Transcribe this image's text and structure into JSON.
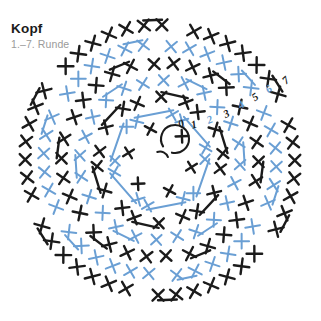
{
  "title": "Kopf",
  "subtitle": "1.–7. Runde",
  "colors": {
    "black": "#1b1b1b",
    "blue": "#6a9fd4",
    "title": "#1b1b1b",
    "subtitle": "#9a9a9a",
    "background": "#ffffff"
  },
  "center": {
    "x": 160,
    "y": 160,
    "ring_radius": 14,
    "icon": "magic-ring-icon"
  },
  "round_labels": [
    {
      "text": "0",
      "x": 182,
      "y": 127,
      "color": "#1b1b1b",
      "rotate": -18,
      "size": 11
    },
    {
      "text": "1",
      "x": 195,
      "y": 128,
      "color": "#1b1b1b",
      "rotate": -16,
      "size": 12
    },
    {
      "text": "2",
      "x": 211,
      "y": 123,
      "color": "#6a9fd4",
      "rotate": -22,
      "size": 11
    },
    {
      "text": "3",
      "x": 228,
      "y": 117,
      "color": "#1b1b1b",
      "rotate": -26,
      "size": 11
    },
    {
      "text": "4",
      "x": 243,
      "y": 108,
      "color": "#6a9fd4",
      "rotate": -30,
      "size": 11
    },
    {
      "text": "5",
      "x": 257,
      "y": 100,
      "color": "#1b1b1b",
      "rotate": -34,
      "size": 11
    },
    {
      "text": "6",
      "x": 271,
      "y": 92,
      "color": "#6a9fd4",
      "rotate": -38,
      "size": 11
    },
    {
      "text": "7",
      "x": 288,
      "y": 83,
      "color": "#1b1b1b",
      "rotate": -42,
      "size": 11
    }
  ],
  "chart_data": {
    "type": "diagram",
    "diagram_kind": "crochet-round-chart",
    "title": "Kopf",
    "subtitle": "1.–7. Runde",
    "stitch_symbol": "x-single-crochet",
    "increase_symbol": "bar-joined-pair",
    "center_symbol": "magic-ring",
    "sector_count": 6,
    "gap_sector_halfwidth_deg": 7,
    "rounds": [
      {
        "round": 1,
        "radius": 30,
        "count": 6,
        "color": "#1b1b1b",
        "size": 9,
        "increases": 0
      },
      {
        "round": 2,
        "radius": 45,
        "count": 12,
        "color": "#6a9fd4",
        "size": 9.5,
        "increases": 6
      },
      {
        "round": 3,
        "radius": 61,
        "count": 18,
        "color": "#1b1b1b",
        "size": 10,
        "increases": 6
      },
      {
        "round": 4,
        "radius": 78,
        "count": 24,
        "color": "#6a9fd4",
        "size": 10,
        "increases": 6
      },
      {
        "round": 5,
        "radius": 96,
        "count": 30,
        "color": "#1b1b1b",
        "size": 10.5,
        "increases": 6
      },
      {
        "round": 6,
        "radius": 114,
        "count": 36,
        "color": "#6a9fd4",
        "size": 10.5,
        "increases": 6
      },
      {
        "round": 7,
        "radius": 133,
        "count": 42,
        "color": "#1b1b1b",
        "size": 11,
        "increases": 6
      }
    ]
  }
}
